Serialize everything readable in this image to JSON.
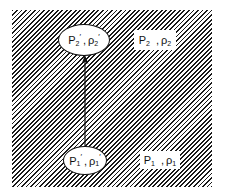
{
  "diagram": {
    "background_pattern": "diagonal-hatching",
    "colors": {
      "ink": "#111111",
      "background": "#ffffff"
    },
    "nodes": [
      {
        "id": "state-2-prime",
        "shape": "ellipse",
        "pressure": "P",
        "pressure_sub": "2",
        "pressure_prime": "′",
        "separator": ",",
        "density": "ρ",
        "density_sub": "2",
        "density_prime": "′"
      },
      {
        "id": "state-1-prime",
        "shape": "ellipse",
        "pressure": "P",
        "pressure_sub": "1",
        "pressure_prime": "′",
        "separator": ",",
        "density": "ρ",
        "density_sub": "1",
        "density_prime": "′"
      },
      {
        "id": "state-2",
        "shape": "label",
        "pressure": "P",
        "pressure_sub": "2",
        "separator": ",",
        "density": "ρ",
        "density_sub": "2"
      },
      {
        "id": "state-1",
        "shape": "label",
        "pressure": "P",
        "pressure_sub": "1",
        "separator": ",",
        "density": "ρ",
        "density_sub": "1"
      }
    ],
    "edges": [
      {
        "from": "state-1-prime",
        "to": "state-2-prime",
        "type": "arrow",
        "direction": "up"
      }
    ]
  }
}
